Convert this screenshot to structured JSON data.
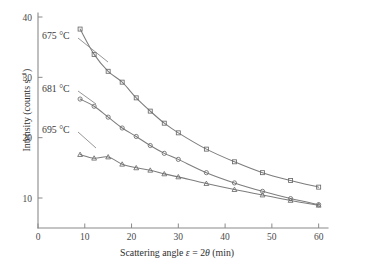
{
  "chart_data": {
    "type": "line",
    "title": "",
    "xlabel": "Scattering angle ε = 2θ (min)",
    "xlabel_parts": {
      "prefix": "Scattering angle ",
      "eps": "ε",
      "eq": " = 2",
      "theta": "θ",
      "unit": " (min)"
    },
    "ylabel": "Intensity (counts s⁻¹)",
    "ylabel_parts": {
      "main": "Intensity (counts s",
      "exp": "−1",
      "close": ")"
    },
    "xlim": [
      0,
      62
    ],
    "ylim": [
      5,
      40
    ],
    "grid": false,
    "legend_position": "inline-annotations",
    "xticks": [
      0,
      10,
      20,
      30,
      40,
      50,
      60
    ],
    "xticklabels": [
      "0",
      "10",
      "20",
      "30",
      "40",
      "50",
      "60"
    ],
    "yticks": [
      10,
      20,
      30,
      40
    ],
    "yticklabels": [
      "10",
      "20",
      "30",
      "40"
    ],
    "series": [
      {
        "name": "675 °C",
        "label": "675 °C",
        "marker": "open-square",
        "color": "#6a6a6a",
        "x": [
          9,
          12,
          15,
          18,
          21,
          24,
          27,
          30,
          36,
          42,
          48,
          54,
          60
        ],
        "y": [
          38.0,
          33.8,
          31.0,
          29.2,
          26.6,
          24.4,
          22.4,
          20.8,
          18.1,
          16.0,
          14.2,
          12.9,
          11.8
        ]
      },
      {
        "name": "681 °C",
        "label": "681 °C",
        "marker": "open-circle",
        "color": "#6a6a6a",
        "x": [
          9,
          12,
          15,
          18,
          21,
          24,
          27,
          30,
          36,
          42,
          48,
          54,
          60
        ],
        "y": [
          26.4,
          25.2,
          23.4,
          21.6,
          20.2,
          18.7,
          17.4,
          16.4,
          14.2,
          12.5,
          11.1,
          9.9,
          8.9
        ]
      },
      {
        "name": "695 °C",
        "label": "695 °C",
        "marker": "open-triangle",
        "color": "#6a6a6a",
        "x": [
          9,
          12,
          15,
          18,
          21,
          24,
          27,
          30,
          36,
          42,
          48,
          54,
          60
        ],
        "y": [
          17.2,
          16.6,
          16.8,
          15.6,
          15.0,
          14.6,
          14.0,
          13.5,
          12.4,
          11.4,
          10.5,
          9.6,
          8.8
        ]
      }
    ],
    "annotations": [
      {
        "text": "675 °C",
        "x_px": 42,
        "y_px": 39,
        "leader_to_x_px": 108,
        "leader_to_y_px": 62
      },
      {
        "text": "681 °C",
        "x_px": 42,
        "y_px": 92,
        "leader_to_x_px": 96,
        "leader_to_y_px": 104
      },
      {
        "text": "695 °C",
        "x_px": 42,
        "y_px": 133,
        "leader_to_x_px": 96,
        "leader_to_y_px": 148
      }
    ]
  }
}
